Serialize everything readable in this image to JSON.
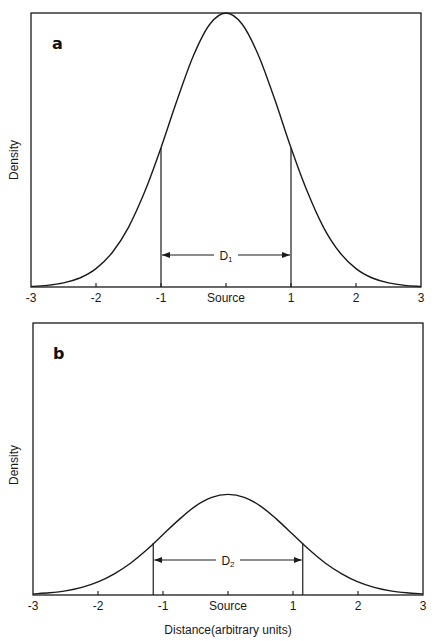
{
  "chart_data": [
    {
      "type": "line",
      "panel": "a",
      "title": "",
      "xlabel": "",
      "ylabel": "Density",
      "xlim": [
        -3,
        3
      ],
      "ylim": [
        0,
        1
      ],
      "grid": false,
      "legend": null,
      "x_ticks": [
        -3,
        -2,
        -1,
        0,
        1,
        2,
        3
      ],
      "x_tick_labels": [
        "-3",
        "-2",
        "-1",
        "Source",
        "1",
        "2",
        "3"
      ],
      "x": [
        -3,
        -2.75,
        -2.5,
        -2.25,
        -2,
        -1.75,
        -1.5,
        -1.25,
        -1,
        -0.75,
        -0.5,
        -0.25,
        0,
        0.25,
        0.5,
        0.75,
        1,
        1.25,
        1.5,
        1.75,
        2,
        2.25,
        2.5,
        2.75,
        3
      ],
      "y": [
        0.002,
        0.006,
        0.015,
        0.033,
        0.067,
        0.126,
        0.218,
        0.348,
        0.508,
        0.684,
        0.845,
        0.959,
        1.0,
        0.959,
        0.845,
        0.684,
        0.508,
        0.348,
        0.218,
        0.126,
        0.067,
        0.033,
        0.015,
        0.006,
        0.002
      ],
      "annotation": {
        "label": "D",
        "subscript": "1",
        "from": -1,
        "to": 1
      }
    },
    {
      "type": "line",
      "panel": "b",
      "title": "",
      "xlabel": "Distance(arbitrary units)",
      "ylabel": "Density",
      "xlim": [
        -3,
        3
      ],
      "ylim": [
        0,
        1
      ],
      "grid": false,
      "legend": null,
      "x_ticks": [
        -3,
        -2,
        -1,
        0,
        1,
        2,
        3
      ],
      "x_tick_labels": [
        "-3",
        "-2",
        "-1",
        "Source",
        "1",
        "2",
        "3"
      ],
      "x": [
        -3,
        -2.75,
        -2.5,
        -2.25,
        -2,
        -1.75,
        -1.5,
        -1.25,
        -1,
        -0.75,
        -0.5,
        -0.25,
        0,
        0.25,
        0.5,
        0.75,
        1,
        1.25,
        1.5,
        1.75,
        2,
        2.25,
        2.5,
        2.75,
        3
      ],
      "y": [
        0.004,
        0.008,
        0.015,
        0.028,
        0.048,
        0.078,
        0.117,
        0.166,
        0.222,
        0.278,
        0.327,
        0.359,
        0.37,
        0.359,
        0.327,
        0.278,
        0.222,
        0.166,
        0.117,
        0.078,
        0.048,
        0.028,
        0.015,
        0.008,
        0.004
      ],
      "annotation": {
        "label": "D",
        "subscript": "2",
        "from": -1.15,
        "to": 1.15
      }
    }
  ],
  "panels": {
    "a": {
      "letter": "a",
      "ylabel": "Density",
      "d_label": "D",
      "d_sub": "1",
      "ticks": [
        "-3",
        "-2",
        "-1",
        "Source",
        "1",
        "2",
        "3"
      ]
    },
    "b": {
      "letter": "b",
      "ylabel": "Density",
      "d_label": "D",
      "d_sub": "2",
      "ticks": [
        "-3",
        "-2",
        "-1",
        "Source",
        "1",
        "2",
        "3"
      ],
      "xlabel": "Distance(arbitrary units)"
    }
  }
}
